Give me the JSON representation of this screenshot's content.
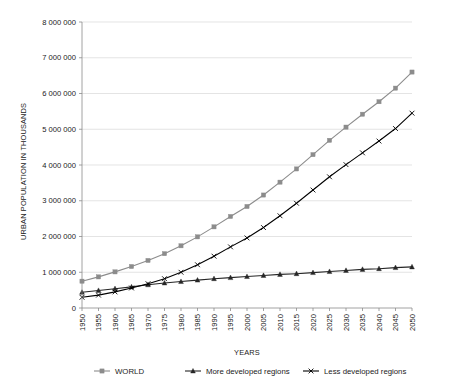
{
  "chart_data": {
    "type": "line",
    "title": "",
    "xlabel": "YEARS",
    "ylabel": "URBAN POPULATION IN THOUSANDS",
    "xlim": [
      1950,
      2050
    ],
    "ylim": [
      0,
      8000000
    ],
    "grid": true,
    "legend_position": "bottom",
    "categories": [
      "1950",
      "1955",
      "1960",
      "1965",
      "1970",
      "1975",
      "1980",
      "1985",
      "1990",
      "1995",
      "2000",
      "2005",
      "2010",
      "2015",
      "2020",
      "2025",
      "2030",
      "2035",
      "2040",
      "2045",
      "2050"
    ],
    "ytick_labels": [
      "0",
      "1 000 000",
      "2 000 000",
      "3 000 000",
      "4 000 000",
      "5 000 000",
      "6 000 000",
      "7 000 000",
      "8 000 000"
    ],
    "ytick_values": [
      0,
      1000000,
      2000000,
      3000000,
      4000000,
      5000000,
      6000000,
      7000000,
      8000000
    ],
    "series": [
      {
        "name": "WORLD",
        "color": "#8c8c8c",
        "marker": "square",
        "values": [
          750000,
          870000,
          1010000,
          1160000,
          1330000,
          1520000,
          1740000,
          1990000,
          2270000,
          2560000,
          2840000,
          3160000,
          3520000,
          3890000,
          4290000,
          4690000,
          5060000,
          5420000,
          5770000,
          6150000,
          6600000
        ]
      },
      {
        "name": "More developed regions",
        "color": "#262626",
        "marker": "triangle",
        "values": [
          440000,
          490000,
          540000,
          590000,
          650000,
          700000,
          740000,
          780000,
          820000,
          850000,
          880000,
          910000,
          940000,
          960000,
          990000,
          1020000,
          1050000,
          1080000,
          1100000,
          1130000,
          1150000
        ]
      },
      {
        "name": "Less developed regions",
        "color": "#000000",
        "marker": "cross",
        "values": [
          300000,
          360000,
          450000,
          560000,
          680000,
          820000,
          1000000,
          1210000,
          1450000,
          1710000,
          1960000,
          2250000,
          2580000,
          2930000,
          3300000,
          3670000,
          4010000,
          4340000,
          4670000,
          5020000,
          5450000
        ]
      }
    ]
  }
}
